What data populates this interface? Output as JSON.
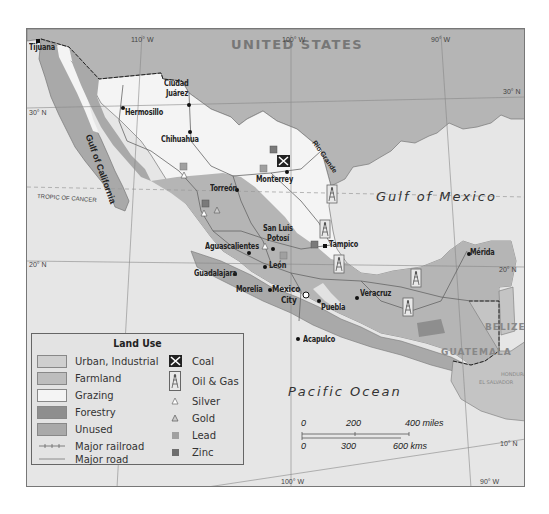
{
  "map": {
    "country_label": "UNITED STATES",
    "water_labels": {
      "gulf_of_california": "Gulf of California",
      "gulf_of_mexico": "Gulf of Mexico",
      "pacific_ocean": "Pacific Ocean",
      "rio_grande": "Rio Grande"
    },
    "neighbor_labels": {
      "belize": "BELIZE",
      "guatemala": "GUATEMALA",
      "honduras": "HONDURAS",
      "el_salvador": "EL SALVADOR"
    },
    "gridlines": {
      "lon_110": "110° W",
      "lon_100_top": "100° W",
      "lon_90_top": "90° W",
      "lon_100_bottom": "100° W",
      "lon_90_bottom": "90° W",
      "lat_30_left": "30° N",
      "lat_30_right": "30° N",
      "lat_20_left": "20° N",
      "lat_20_right": "20° N",
      "lat_10": "10° N",
      "tropic": "TROPIC OF CANCER"
    },
    "cities": {
      "tijuana": "Tijuana",
      "ciudad_juarez_1": "Ciudad",
      "ciudad_juarez_2": "Juárez",
      "hermosillo": "Hermosillo",
      "chihuahua": "Chihuahua",
      "monterrey": "Monterrey",
      "torreon": "Torreón",
      "san_luis_potosi_1": "San Luis",
      "san_luis_potosi_2": "Potosí",
      "tampico": "Tampico",
      "aguascalientes": "Aguascalientes",
      "leon": "León",
      "guadalajara": "Guadalajara",
      "morelia": "Morelia",
      "mexico_city_1": "Mexico",
      "mexico_city_2": "City",
      "puebla": "Puebla",
      "veracruz": "Veracruz",
      "acapulco": "Acapulco",
      "merida": "Mérida"
    },
    "colors": {
      "water": "#e6e6e6",
      "us_land": "#b5b5b5",
      "urban": "#cfcfcf",
      "farmland": "#bdbdbd",
      "grazing": "#f4f4f4",
      "forestry": "#8e8e8e",
      "unused": "#a9a9a9",
      "coast": "#777777"
    }
  },
  "legend": {
    "title": "Land Use",
    "land_use": [
      {
        "label": "Urban, Industrial",
        "color": "#cfcfcf"
      },
      {
        "label": "Farmland",
        "color": "#bdbdbd"
      },
      {
        "label": "Grazing",
        "color": "#f4f4f4"
      },
      {
        "label": "Forestry",
        "color": "#8e8e8e"
      },
      {
        "label": "Unused",
        "color": "#a9a9a9"
      }
    ],
    "lines": [
      {
        "label": "Major railroad",
        "icon": "railroad-line-icon"
      },
      {
        "label": "Major road",
        "icon": "road-line-icon"
      }
    ],
    "resources": [
      {
        "label": "Coal",
        "icon": "coal-pickaxe-icon"
      },
      {
        "label": "Oil & Gas",
        "icon": "oil-derrick-icon"
      },
      {
        "label": "Silver",
        "icon": "silver-triangle-icon"
      },
      {
        "label": "Gold",
        "icon": "gold-triangle-icon"
      },
      {
        "label": "Lead",
        "icon": "lead-square-icon"
      },
      {
        "label": "Zinc",
        "icon": "zinc-square-icon"
      }
    ]
  },
  "scale_bar": {
    "miles": [
      "0",
      "200",
      "400 miles"
    ],
    "kms": [
      "0",
      "300",
      "600 kms"
    ]
  }
}
